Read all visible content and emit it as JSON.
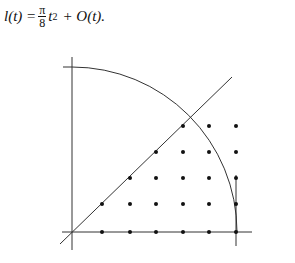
{
  "formula": {
    "lhs": "l(t) =",
    "frac_num": "π",
    "frac_den": "8",
    "term": "t",
    "exponent": "2",
    "rest": "+ O(t)."
  },
  "figure": {
    "origin": [
      72,
      232
    ],
    "radius": 165,
    "axes": {
      "x_axis": {
        "from": [
          62,
          232
        ],
        "to": [
          252,
          232
        ]
      },
      "y_axis": {
        "from": [
          72,
          57
        ],
        "to": [
          72,
          250
        ]
      }
    },
    "diagonal": {
      "from": [
        60,
        244
      ],
      "to": [
        232,
        77
      ]
    },
    "right_vertical": {
      "x": 236,
      "from": 175,
      "to": 246
    },
    "lattice_rows": [
      {
        "y": 232,
        "x": [
          102,
          130,
          156,
          183,
          209,
          236
        ]
      },
      {
        "y": 204,
        "x": [
          102,
          130,
          156,
          183,
          209,
          236
        ]
      },
      {
        "y": 178,
        "x": [
          130,
          156,
          183,
          209,
          236
        ]
      },
      {
        "y": 152,
        "x": [
          156,
          183,
          209,
          236
        ]
      },
      {
        "y": 126,
        "x": [
          183,
          209,
          236
        ]
      }
    ],
    "line_color": "#333333",
    "dot_color": "#111111"
  }
}
